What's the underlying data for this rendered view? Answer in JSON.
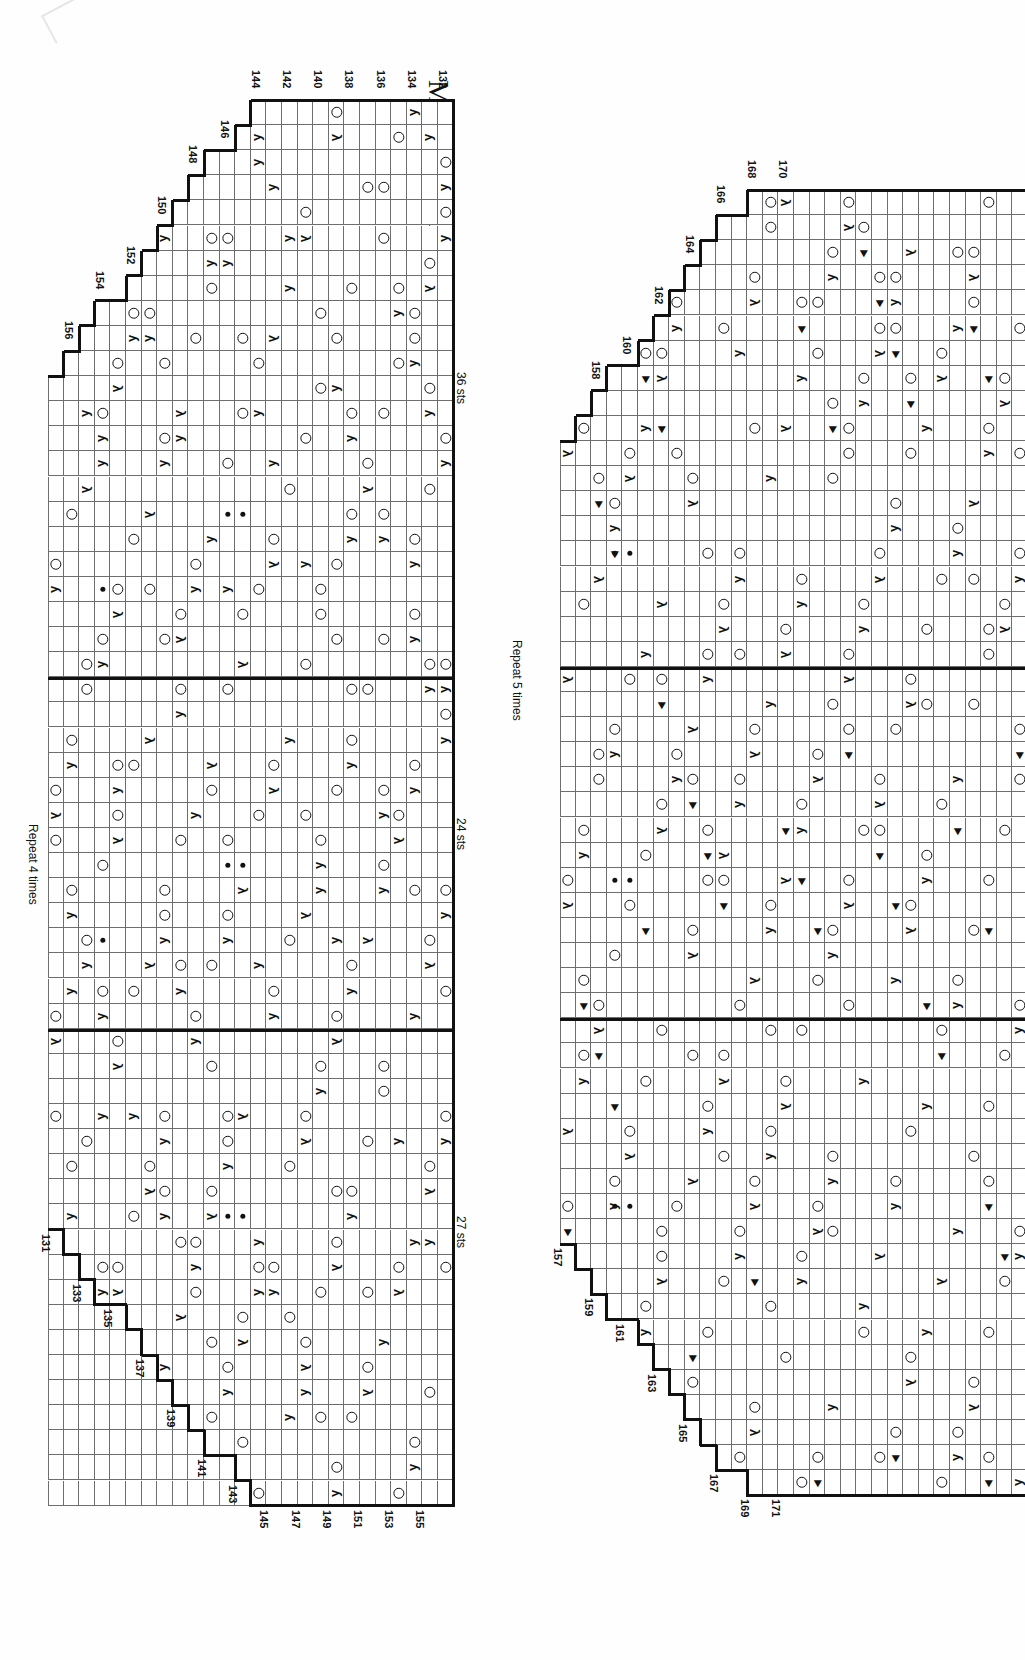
{
  "document": {
    "title": "Mystic Light – CHART D",
    "kind": "knitting-lace-chart",
    "orientation": "rotated-90-clockwise"
  },
  "legend_symbols": {
    "yo": "yarn-over-circle",
    "purl": "purl-dot",
    "k2tog": "right-leaning-decrease",
    "ssk": "left-leaning-decrease",
    "cdd": "centered-double-decrease"
  },
  "chart_data": {
    "type": "table",
    "title": "Mystic Light – CHART D",
    "charts": [
      {
        "name": "chart-d-panel-1",
        "row_range": [
          131,
          156
        ],
        "row_numbers_top": [
          132,
          134,
          136,
          138,
          140,
          142,
          144,
          146,
          148,
          150,
          152,
          154,
          156
        ],
        "row_numbers_bottom": [
          131,
          133,
          135,
          137,
          139,
          141,
          143,
          145,
          147,
          149,
          151,
          153,
          155
        ],
        "stitch_counts": [
          "36 sts",
          "24 sts",
          "27 sts"
        ],
        "repeat_label": "Repeat 4 times",
        "columns": 26,
        "rows": 56
      },
      {
        "name": "chart-d-panel-2",
        "row_range": [
          157,
          171
        ],
        "row_numbers_top": [
          158,
          160,
          162,
          164,
          166,
          168,
          170
        ],
        "row_numbers_bottom": [
          157,
          159,
          161,
          163,
          165,
          167,
          169,
          171
        ],
        "repeat_label": "Repeat 5 times",
        "columns": 15,
        "rows": 56,
        "cropped_at_page_edge": true
      }
    ]
  },
  "panel1": {
    "top_row_numbers": [
      "132",
      "134",
      "136",
      "138",
      "140",
      "142",
      "144",
      "146",
      "148",
      "150",
      "152",
      "154",
      "156"
    ],
    "bottom_row_numbers": [
      "131",
      "133",
      "135",
      "137",
      "139",
      "141",
      "143",
      "145",
      "147",
      "149",
      "151",
      "153",
      "155"
    ],
    "stitch_label_1": "36 sts",
    "stitch_label_2": "24 sts",
    "stitch_label_3": "27 sts",
    "repeat_label": "Repeat 4 times"
  },
  "panel2": {
    "top_row_numbers": [
      "158",
      "160",
      "162",
      "164",
      "166",
      "168",
      "170"
    ],
    "bottom_row_numbers": [
      "157",
      "159",
      "161",
      "163",
      "165",
      "167",
      "169",
      "171"
    ],
    "repeat_label": "Repeat 5 times"
  },
  "colors": {
    "grid_line": "#6e6e6e",
    "outline": "#111111",
    "background": "#ffffff"
  }
}
